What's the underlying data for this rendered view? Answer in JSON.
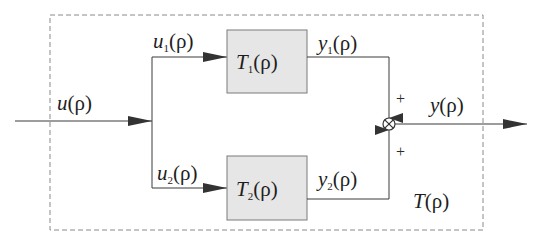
{
  "diagram": {
    "type": "block-diagram",
    "colors": {
      "line": "#3a3a3a",
      "block_fill": "#e6e6e6",
      "block_stroke": "#7a7a7a",
      "dashed_border": "#8a8a8a",
      "text": "#1e1e1e"
    },
    "input": {
      "var": "u",
      "sub": "",
      "arg": "(ρ)"
    },
    "branch_top": {
      "var": "u",
      "sub": "1",
      "arg": "(ρ)"
    },
    "branch_bottom": {
      "var": "u",
      "sub": "2",
      "arg": "(ρ)"
    },
    "block_top": {
      "var": "T",
      "sub": "1",
      "arg": "(ρ)"
    },
    "block_bottom": {
      "var": "T",
      "sub": "2",
      "arg": "(ρ)"
    },
    "out_top": {
      "var": "y",
      "sub": "1",
      "arg": "(ρ)"
    },
    "out_bottom": {
      "var": "y",
      "sub": "2",
      "arg": "(ρ)"
    },
    "output": {
      "var": "y",
      "sub": "",
      "arg": "(ρ)"
    },
    "system": {
      "var": "T",
      "sub": "",
      "arg": "(ρ)"
    },
    "junction": {
      "symbol": "⊗",
      "sign_top": "+",
      "sign_bottom": "+"
    }
  }
}
